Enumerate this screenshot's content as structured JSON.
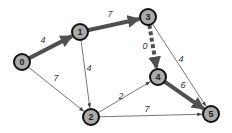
{
  "graph": {
    "type": "directed-weighted",
    "colors": {
      "node_fill": "#aaaaaa",
      "node_stroke": "#111111",
      "edge_thin": "#555555",
      "edge_thick": "#505050"
    },
    "nodes": [
      {
        "id": "0",
        "label": "0",
        "x": 22,
        "y": 62
      },
      {
        "id": "1",
        "label": "1",
        "x": 80,
        "y": 32
      },
      {
        "id": "2",
        "label": "2",
        "x": 91,
        "y": 117
      },
      {
        "id": "3",
        "label": "3",
        "x": 148,
        "y": 17
      },
      {
        "id": "4",
        "label": "4",
        "x": 158,
        "y": 77
      },
      {
        "id": "5",
        "label": "5",
        "x": 211,
        "y": 114
      }
    ],
    "edges": [
      {
        "from": "0",
        "to": "1",
        "weight": "4",
        "style": "thick",
        "label_x": 43,
        "label_y": 43
      },
      {
        "from": "0",
        "to": "2",
        "weight": "7",
        "style": "thin",
        "label_x": 56,
        "label_y": 81
      },
      {
        "from": "1",
        "to": "3",
        "weight": "7",
        "style": "thick",
        "label_x": 110,
        "label_y": 17
      },
      {
        "from": "1",
        "to": "2",
        "weight": "4",
        "style": "thin",
        "label_x": 89,
        "label_y": 71
      },
      {
        "from": "2",
        "to": "4",
        "weight": "2",
        "style": "thin",
        "label_x": 121,
        "label_y": 99
      },
      {
        "from": "2",
        "to": "5",
        "weight": "7",
        "style": "thin",
        "label_x": 147,
        "label_y": 112
      },
      {
        "from": "3",
        "to": "4",
        "weight": "0",
        "style": "thick-dashed",
        "label_x": 145,
        "label_y": 49
      },
      {
        "from": "3",
        "to": "5",
        "weight": "4",
        "style": "thin",
        "label_x": 181,
        "label_y": 62
      },
      {
        "from": "4",
        "to": "5",
        "weight": "6",
        "style": "thick",
        "label_x": 183,
        "label_y": 88
      }
    ]
  }
}
